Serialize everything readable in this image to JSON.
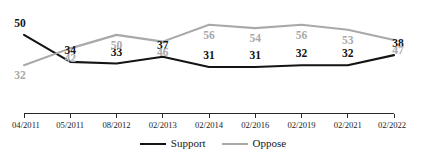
{
  "chart_data": {
    "type": "line",
    "title": "",
    "subtitle": "",
    "xlabel": "",
    "ylabel": "",
    "grid": false,
    "legend_position": "bottom-center",
    "ylim": [
      28,
      60
    ],
    "categories": [
      "04/2011",
      "05/2011",
      "08/2012",
      "02/2013",
      "02/2014",
      "02/2016",
      "02/2019",
      "02/2021",
      "02/2022"
    ],
    "series": [
      {
        "name": "Support",
        "color": "#141414",
        "values": [
          50,
          34,
          33,
          37,
          31,
          31,
          32,
          32,
          38
        ]
      },
      {
        "name": "Oppose",
        "color": "#a9a9a9",
        "values": [
          32,
          42,
          50,
          46,
          56,
          54,
          56,
          53,
          47
        ]
      }
    ]
  },
  "axis": {
    "tick_labels": [
      "04/2011",
      "05/2011",
      "08/2012",
      "02/2013",
      "02/2014",
      "02/2016",
      "02/2019",
      "02/2021",
      "02/2022"
    ]
  },
  "legend": {
    "items": [
      {
        "label": "Support",
        "color": "#141414"
      },
      {
        "label": "Oppose",
        "color": "#a9a9a9"
      }
    ]
  }
}
